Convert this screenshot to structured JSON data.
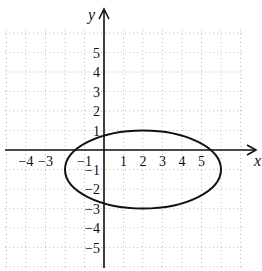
{
  "chart_data": {
    "type": "line",
    "title": "",
    "xlabel": "x",
    "ylabel": "y",
    "xlim": [
      -5,
      7
    ],
    "ylim": [
      -6,
      6
    ],
    "grid": true,
    "grid_style": "dotted",
    "x_ticks": [
      {
        "value": -4,
        "label": "−4"
      },
      {
        "value": -3,
        "label": "−3"
      },
      {
        "value": -1,
        "label": "−1"
      },
      {
        "value": 1,
        "label": "1"
      },
      {
        "value": 2,
        "label": "2"
      },
      {
        "value": 3,
        "label": "3"
      },
      {
        "value": 4,
        "label": "4"
      },
      {
        "value": 5,
        "label": "5"
      }
    ],
    "y_ticks": [
      {
        "value": 5,
        "label": "5"
      },
      {
        "value": 4,
        "label": "4"
      },
      {
        "value": 3,
        "label": "3"
      },
      {
        "value": 2,
        "label": "2"
      },
      {
        "value": 1,
        "label": "1"
      },
      {
        "value": -1,
        "label": "−1"
      },
      {
        "value": -2,
        "label": "−2"
      },
      {
        "value": -3,
        "label": "−3"
      },
      {
        "value": -4,
        "label": "−4"
      },
      {
        "value": -5,
        "label": "−5"
      }
    ],
    "series": [
      {
        "name": "ellipse",
        "shape": "ellipse",
        "center": [
          2,
          -1
        ],
        "semi_axis_x": 4,
        "semi_axis_y": 2,
        "equation": "(x-2)^2/16 + (y+1)^2/4 = 1",
        "x_intercepts": [
          -1.46,
          5.46
        ],
        "y_intercepts": [
          0.73,
          -2.73
        ]
      }
    ]
  }
}
